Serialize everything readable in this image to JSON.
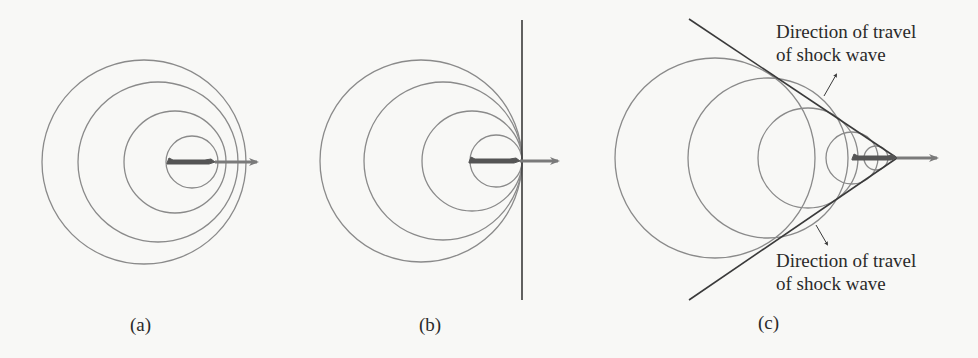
{
  "figure": {
    "colors": {
      "wavefront": "#8a8a8a",
      "shock_line": "#3a3a3a",
      "arrow": "#7a7a7a",
      "plane": "#555555",
      "text": "#2a2a2a",
      "background": "#f8f8f6"
    },
    "panels": [
      {
        "id": "a",
        "caption": "(a)",
        "description": "Source moving slower than sound: wavefronts nested, not touching",
        "circles": [
          {
            "cx": 144,
            "cy": 162,
            "r": 102
          },
          {
            "cx": 158,
            "cy": 162,
            "r": 80
          },
          {
            "cx": 175,
            "cy": 162,
            "r": 51
          },
          {
            "cx": 192,
            "cy": 162,
            "r": 26
          }
        ],
        "plane": {
          "x1": 167,
          "x2": 215,
          "y": 162
        },
        "arrow": {
          "x1": 215,
          "x2": 257,
          "y": 162
        }
      },
      {
        "id": "b",
        "caption": "(b)",
        "description": "Source moving at the speed of sound: wavefronts touch at a single vertical front",
        "circles": [
          {
            "cx": 421,
            "cy": 161,
            "r": 101
          },
          {
            "cx": 443,
            "cy": 161,
            "r": 79
          },
          {
            "cx": 472,
            "cy": 161,
            "r": 50
          },
          {
            "cx": 496,
            "cy": 161,
            "r": 26
          }
        ],
        "front_line": {
          "x1": 522,
          "y1": 20,
          "x2": 522,
          "y2": 300
        },
        "plane": {
          "x1": 469,
          "x2": 520,
          "y": 161
        },
        "arrow": {
          "x1": 520,
          "x2": 558,
          "y": 161
        }
      },
      {
        "id": "c",
        "caption": "(c)",
        "description": "Source moving faster than sound: wavefronts form a shock cone",
        "circles": [
          {
            "cx": 715,
            "cy": 158,
            "r": 100
          },
          {
            "cx": 768,
            "cy": 158,
            "r": 80
          },
          {
            "cx": 808,
            "cy": 158,
            "r": 50
          },
          {
            "cx": 852,
            "cy": 158,
            "r": 26
          },
          {
            "cx": 876,
            "cy": 158,
            "r": 12
          }
        ],
        "cone_lines": [
          {
            "x1": 689,
            "y1": 19,
            "x2": 897,
            "y2": 158
          },
          {
            "x1": 689,
            "y1": 300,
            "x2": 897,
            "y2": 158
          }
        ],
        "plane": {
          "x1": 852,
          "x2": 897,
          "y": 158
        },
        "arrow": {
          "x1": 897,
          "x2": 937,
          "y": 158
        },
        "annotations": [
          {
            "line1": "Direction of travel",
            "line2": "of shock wave",
            "pointer": {
              "x1": 824,
              "y1": 96,
              "x2": 836,
              "y2": 75
            }
          },
          {
            "line1": "Direction of travel",
            "line2": "of shock wave",
            "pointer": {
              "x1": 816,
              "y1": 225,
              "x2": 827,
              "y2": 244
            }
          }
        ]
      }
    ]
  }
}
